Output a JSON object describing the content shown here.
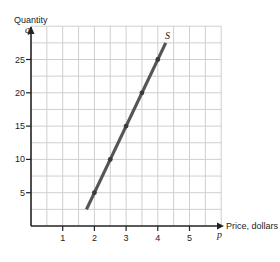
{
  "chart_data": {
    "type": "line",
    "title": "",
    "xlabel": "Price, dollars",
    "ylabel": "Quantity",
    "x_symbol": "p",
    "y_symbol": "q",
    "xlim": [
      0,
      6
    ],
    "ylim": [
      0,
      30
    ],
    "x_ticks": [
      1,
      2,
      3,
      4,
      5
    ],
    "y_ticks": [
      5,
      10,
      15,
      20,
      25
    ],
    "x_tick_labels": [
      "1",
      "2",
      "3",
      "4",
      "5"
    ],
    "y_tick_labels": [
      "5",
      "10",
      "15",
      "20",
      "25"
    ],
    "grid": true,
    "grid_step": {
      "x": 0.5,
      "y": 2.5
    },
    "legend": null,
    "series": [
      {
        "name": "S",
        "label": "S",
        "color": "#555555",
        "line_start": {
          "x": 1.75,
          "y": 2.5
        },
        "line_end": {
          "x": 4.25,
          "y": 27.5
        },
        "points": [
          {
            "x": 2,
            "y": 5
          },
          {
            "x": 2.5,
            "y": 10
          },
          {
            "x": 3,
            "y": 15
          },
          {
            "x": 3.5,
            "y": 20
          },
          {
            "x": 4,
            "y": 25
          }
        ]
      }
    ]
  },
  "labels": {
    "y_axis_title": "Quantity",
    "y_symbol": "q",
    "x_axis_title": "Price, dollars",
    "x_symbol": "p",
    "curve_label": "S"
  },
  "colors": {
    "axis": "#222222",
    "grid": "#cfcfcf",
    "curve": "#555555"
  }
}
